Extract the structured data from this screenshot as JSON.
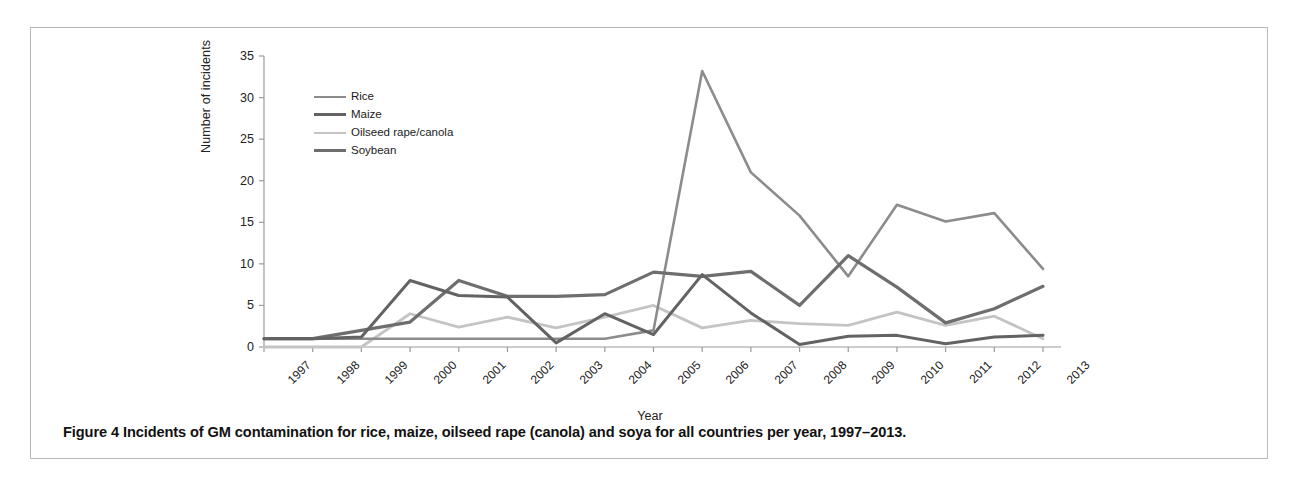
{
  "figure": {
    "caption_label": "Figure 4",
    "caption_text": "Incidents of GM contamination for rice, maize, oilseed rape (canola) and soya for all countries per year, 1997–2013."
  },
  "chart_data": {
    "type": "line",
    "title": "",
    "xlabel": "Year",
    "ylabel": "Number of incidents",
    "categories": [
      "1997",
      "1998",
      "1999",
      "2000",
      "2001",
      "2002",
      "2003",
      "2004",
      "2005",
      "2006",
      "2007",
      "2008",
      "2009",
      "2010",
      "2011",
      "2012",
      "2013"
    ],
    "ylim": [
      0,
      35
    ],
    "yticks": [
      0,
      5,
      10,
      15,
      20,
      25,
      30,
      35
    ],
    "grid": false,
    "legend_position": "top-left",
    "series": [
      {
        "name": "Rice",
        "color": "#8c8c8c",
        "width": 2.6,
        "dash": "none",
        "values": [
          1,
          1,
          1,
          1,
          1,
          1,
          1,
          1,
          2,
          33.2,
          21,
          15.8,
          8.5,
          17.1,
          15.1,
          16.1,
          9.4
        ]
      },
      {
        "name": "Maize",
        "color": "#636363",
        "width": 3.0,
        "dash": "none",
        "values": [
          1,
          1,
          1.2,
          8,
          6.2,
          6,
          0.5,
          4,
          1.5,
          8.7,
          4.1,
          0.3,
          1.3,
          1.4,
          0.4,
          1.2,
          1.4
        ]
      },
      {
        "name": "Oilseed rape/canola",
        "color": "#c4c4c4",
        "width": 2.8,
        "dash": "none",
        "values": [
          0,
          0,
          0,
          4,
          2.4,
          3.6,
          2.3,
          3.6,
          5,
          2.3,
          3.2,
          2.8,
          2.6,
          4.2,
          2.6,
          3.7,
          1
        ]
      },
      {
        "name": "Soybean",
        "color": "#6e6e6e",
        "width": 3.2,
        "dash": "none",
        "values": [
          1,
          1,
          2,
          3,
          8,
          6.1,
          6.1,
          6.3,
          9,
          8.5,
          9.1,
          5,
          11,
          7.2,
          2.9,
          4.6,
          7.3
        ]
      }
    ]
  },
  "axes": {
    "y_tick_labels": [
      "35",
      "30",
      "25",
      "20",
      "15",
      "10",
      "5",
      "0"
    ],
    "x_tick_labels": [
      "1997",
      "1998",
      "1999",
      "2000",
      "2001",
      "2002",
      "2003",
      "2004",
      "2005",
      "2006",
      "2007",
      "2008",
      "2009",
      "2010",
      "2011",
      "2012",
      "2013"
    ]
  }
}
